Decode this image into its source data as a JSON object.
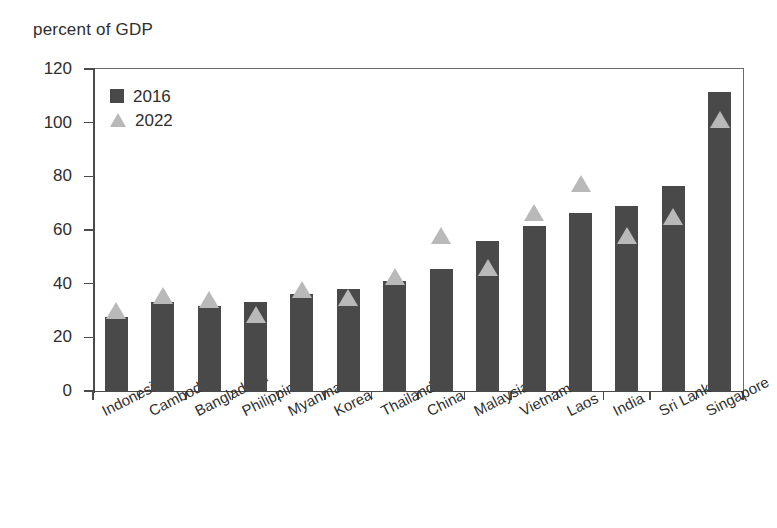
{
  "chart_data": {
    "type": "bar",
    "title": "",
    "ylabel": "percent of GDP",
    "xlabel": "",
    "ylim": [
      0,
      120
    ],
    "yticks": [
      0,
      20,
      40,
      60,
      80,
      100,
      120
    ],
    "grid": false,
    "legend_position": "top-left",
    "categories": [
      "Indonesia",
      "Cambodia",
      "Bangladesh",
      "Philippines",
      "Myanmar",
      "Korea",
      "Thailand",
      "China",
      "Malaysia",
      "Vietnam",
      "Laos",
      "India",
      "Sri Lanka",
      "Singapore"
    ],
    "series": [
      {
        "name": "2016",
        "marker": "bar",
        "color": "#494949",
        "values": [
          27.5,
          33.0,
          31.5,
          33.0,
          36.0,
          38.0,
          41.0,
          45.5,
          56.0,
          61.5,
          66.5,
          69.0,
          76.5,
          111.5
        ]
      },
      {
        "name": "2022",
        "marker": "triangle",
        "color": "#b9b9b9",
        "values": [
          30.0,
          35.5,
          34.0,
          28.5,
          38.0,
          35.0,
          42.5,
          58.0,
          46.0,
          66.5,
          77.5,
          58.0,
          65.0,
          101.0
        ]
      }
    ]
  },
  "legend": {
    "items": [
      {
        "label": "2016",
        "marker": "square"
      },
      {
        "label": "2022",
        "marker": "triangle"
      }
    ]
  },
  "colors": {
    "series_2016": "#494949",
    "series_2022": "#b9b9b9",
    "axis": "#4b4b4b",
    "text": "#2e2e2e",
    "background": "#ffffff"
  }
}
